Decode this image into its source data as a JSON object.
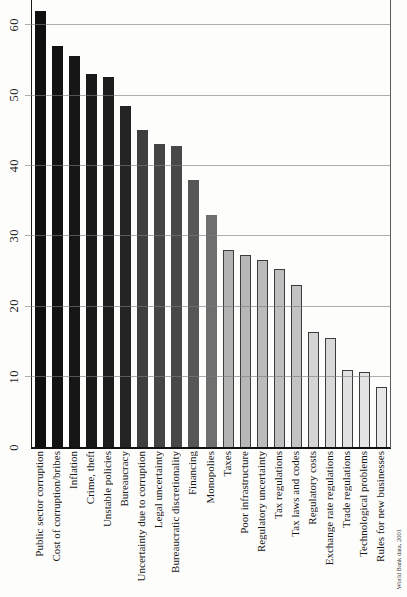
{
  "chart_data": {
    "type": "bar",
    "title": "",
    "xlabel": "",
    "ylabel": "",
    "ylim": [
      0,
      63.5
    ],
    "yticks": [
      0,
      10,
      20,
      30,
      40,
      50,
      60
    ],
    "grid": true,
    "legend": "none",
    "categories": [
      "Public sector corruption",
      "Cost of corruption/bribes",
      "Inflation",
      "Crime, theft",
      "Unstable policies",
      "Bureaucracy",
      "Uncertainty due to corruption",
      "Legal uncertainty",
      "Bureaucratic discretionality",
      "Financing",
      "Monopolies",
      "Taxes",
      "Poor infrastructure",
      "Regulatory uncertainty",
      "Tax regulations",
      "Tax laws and codes",
      "Regulatory costs",
      "Exchange rate regulations",
      "Trade regulations",
      "Technological problems",
      "Rules for new businesses"
    ],
    "values": [
      62,
      57,
      55.5,
      53,
      52.5,
      48.5,
      45,
      43,
      42.8,
      38,
      33,
      28,
      27.3,
      26.6,
      25.3,
      23,
      16.4,
      15.5,
      11,
      10.6,
      8.5
    ],
    "bar_colors": [
      "#0f0f0f",
      "#121212",
      "#161616",
      "#191919",
      "#1d1d1d",
      "#242424",
      "#3f3f3f",
      "#444444",
      "#484848",
      "#565656",
      "#6f6f6f",
      "#b3b3b3",
      "#b7b7b7",
      "#bbbbbb",
      "#bfbfbf",
      "#c3c3c3",
      "#d4d4d4",
      "#d8d8d8",
      "#e1e1e1",
      "#e4e4e4",
      "#e8e8e8"
    ],
    "source_note": "World Bank data, 2001"
  }
}
